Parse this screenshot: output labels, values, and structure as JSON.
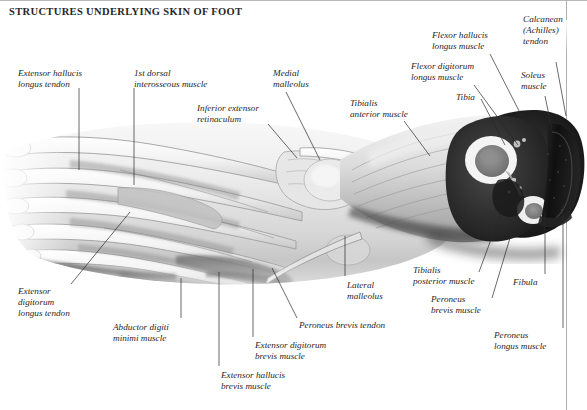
{
  "plate": {
    "title": "STRUCTURES UNDERLYING SKIN OF FOOT",
    "subject": "foot-and-lower-leg-dissection",
    "style": "grayscale anatomical atlas plate",
    "background_color": "#ffffff",
    "text_color": "#1f1f1f",
    "rule_color": "#b9b9b9"
  },
  "labels": [
    {
      "id": "extensor-hallucis-longus-tendon",
      "text": "Extensor hallucis\nlongus tendon",
      "x": 18,
      "y": 68,
      "align": "left"
    },
    {
      "id": "first-dorsal-interosseous-muscle",
      "text": "1st dorsal\ninterosseous muscle",
      "x": 134,
      "y": 68,
      "align": "left"
    },
    {
      "id": "medial-malleolus",
      "text": "Medial\nmalleolus",
      "x": 273,
      "y": 68,
      "align": "left"
    },
    {
      "id": "inferior-extensor-retinaculum",
      "text": "Inferior extensor\nretinaculum",
      "x": 197,
      "y": 103,
      "align": "left"
    },
    {
      "id": "tibialis-anterior-muscle",
      "text": "Tibialis\nanterior muscle",
      "x": 350,
      "y": 98,
      "align": "left"
    },
    {
      "id": "flexor-hallucis-longus-muscle",
      "text": "Flexor hallucis\nlongus muscle",
      "x": 432,
      "y": 30,
      "align": "left"
    },
    {
      "id": "flexor-digitorum-longus-muscle",
      "text": "Flexor digitorum\nlongus muscle",
      "x": 411,
      "y": 61,
      "align": "left"
    },
    {
      "id": "tibia",
      "text": "Tibia",
      "x": 456,
      "y": 92,
      "align": "left"
    },
    {
      "id": "calcanean-achilles-tendon",
      "text": "Calcanean\n(Achilles)\ntendon",
      "x": 523,
      "y": 14,
      "align": "left"
    },
    {
      "id": "soleus-muscle",
      "text": "Soleus\nmuscle",
      "x": 521,
      "y": 70,
      "align": "left"
    },
    {
      "id": "extensor-digitorum-longus-tendon",
      "text": "Extensor\ndigitorum\nlongus tendon",
      "x": 18,
      "y": 286,
      "align": "left"
    },
    {
      "id": "abductor-digiti-minimi-muscle",
      "text": "Abductor digiti\nminimi muscle",
      "x": 113,
      "y": 322,
      "align": "left"
    },
    {
      "id": "extensor-hallucis-brevis-muscle",
      "text": "Extensor hallucis\nbrevis muscle",
      "x": 221,
      "y": 370,
      "align": "left"
    },
    {
      "id": "extensor-digitorum-brevis-muscle",
      "text": "Extensor digitorum\nbrevis muscle",
      "x": 255,
      "y": 340,
      "align": "left"
    },
    {
      "id": "peroneus-brevis-tendon",
      "text": "Peroneus brevis tendon",
      "x": 299,
      "y": 320,
      "align": "left"
    },
    {
      "id": "lateral-malleolus",
      "text": "Lateral\nmalleolus",
      "x": 347,
      "y": 280,
      "align": "left"
    },
    {
      "id": "tibialis-posterior-muscle",
      "text": "Tibialis\nposterior muscle",
      "x": 413,
      "y": 265,
      "align": "left"
    },
    {
      "id": "peroneus-brevis-muscle",
      "text": "Peroneus\nbrevis muscle",
      "x": 431,
      "y": 294,
      "align": "left"
    },
    {
      "id": "fibula",
      "text": "Fibula",
      "x": 513,
      "y": 277,
      "align": "left"
    },
    {
      "id": "peroneus-longus-muscle",
      "text": "Peroneus\nlongus muscle",
      "x": 494,
      "y": 330,
      "align": "left"
    }
  ],
  "leader_lines": [
    {
      "for": "extensor-hallucis-longus-tendon",
      "x1": 79,
      "y1": 88,
      "x2": 79,
      "y2": 170
    },
    {
      "for": "first-dorsal-interosseous-muscle",
      "x1": 134,
      "y1": 88,
      "x2": 134,
      "y2": 185
    },
    {
      "for": "medial-malleolus",
      "x1": 286,
      "y1": 92,
      "x2": 320,
      "y2": 160
    },
    {
      "for": "inferior-extensor-retinaculum",
      "x1": 268,
      "y1": 124,
      "x2": 297,
      "y2": 158
    },
    {
      "for": "tibialis-anterior-muscle",
      "x1": 404,
      "y1": 121,
      "x2": 430,
      "y2": 156
    },
    {
      "for": "flexor-hallucis-longus-muscle",
      "x1": 490,
      "y1": 54,
      "x2": 540,
      "y2": 152
    },
    {
      "for": "flexor-digitorum-longus-muscle",
      "x1": 474,
      "y1": 85,
      "x2": 518,
      "y2": 145
    },
    {
      "for": "tibia",
      "x1": 481,
      "y1": 99,
      "x2": 505,
      "y2": 145
    },
    {
      "for": "calcanean-achilles-tendon",
      "x1": 556,
      "y1": 62,
      "x2": 566,
      "y2": 116
    },
    {
      "for": "soleus-muscle",
      "x1": 545,
      "y1": 96,
      "x2": 552,
      "y2": 130
    },
    {
      "for": "extensor-digitorum-longus-tendon",
      "x1": 71,
      "y1": 284,
      "x2": 130,
      "y2": 212
    },
    {
      "for": "abductor-digiti-minimi-muscle",
      "x1": 181,
      "y1": 318,
      "x2": 181,
      "y2": 278
    },
    {
      "for": "extensor-hallucis-brevis-muscle",
      "x1": 219,
      "y1": 366,
      "x2": 219,
      "y2": 272
    },
    {
      "for": "extensor-digitorum-brevis-muscle",
      "x1": 253,
      "y1": 337,
      "x2": 253,
      "y2": 269
    },
    {
      "for": "peroneus-brevis-tendon",
      "x1": 297,
      "y1": 318,
      "x2": 272,
      "y2": 268
    },
    {
      "for": "lateral-malleolus",
      "x1": 345,
      "y1": 276,
      "x2": 345,
      "y2": 236
    },
    {
      "for": "tibialis-posterior-muscle",
      "x1": 479,
      "y1": 272,
      "x2": 500,
      "y2": 215
    },
    {
      "for": "peroneus-brevis-muscle",
      "x1": 492,
      "y1": 298,
      "x2": 513,
      "y2": 228
    },
    {
      "for": "fibula",
      "x1": 545,
      "y1": 274,
      "x2": 545,
      "y2": 212
    },
    {
      "for": "peroneus-longus-muscle",
      "x1": 563,
      "y1": 328,
      "x2": 563,
      "y2": 205
    }
  ]
}
